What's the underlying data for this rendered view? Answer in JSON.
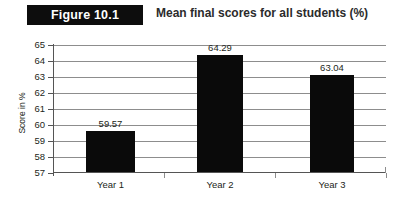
{
  "header": {
    "badge_label": "Figure 10.1",
    "title": "Mean final scores for all students (%)",
    "badge_bg": "#0d0d0d",
    "badge_text_color": "#ffffff"
  },
  "chart_data": {
    "type": "bar",
    "title": "Mean final scores for all students (%)",
    "categories": [
      "Year 1",
      "Year 2",
      "Year 3"
    ],
    "values": [
      59.57,
      64.29,
      63.04
    ],
    "value_labels": [
      "59.57",
      "64.29",
      "63.04"
    ],
    "xlabel": "Year of study",
    "ylabel": "Score in %",
    "ylim": [
      57,
      65
    ],
    "ytick_labels": [
      "65",
      "64",
      "63",
      "62",
      "61",
      "60",
      "59",
      "58",
      "57"
    ],
    "ytick_values": [
      65,
      64,
      63,
      62,
      61,
      60,
      59,
      58,
      57
    ],
    "grid": true,
    "legend": "none",
    "bar_color": "#0a0a0a",
    "gridline_color": "#8d8d8d",
    "background": "#ffffff"
  }
}
